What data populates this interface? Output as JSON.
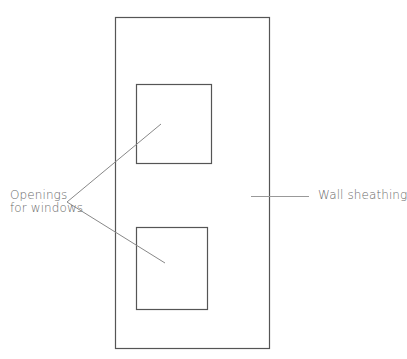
{
  "diagram": {
    "type": "wall-sheathing-elevation",
    "labels": {
      "openings_line1": "Openings",
      "openings_line2": "for windows",
      "wall_sheathing": "Wall sheathing"
    },
    "colors": {
      "outline": "#555555",
      "leader": "#888888",
      "text": "#6a6a6a"
    },
    "shapes": {
      "wall_panel": {
        "x": 115,
        "y": 17,
        "width": 154,
        "height": 331
      },
      "window_upper": {
        "x": 136,
        "y": 84,
        "width": 75,
        "height": 79
      },
      "window_lower": {
        "x": 136,
        "y": 227,
        "width": 71,
        "height": 82
      }
    },
    "leaders": {
      "openings_to_upper": {
        "x1": 67,
        "y1": 202,
        "x2": 161,
        "y2": 124
      },
      "openings_to_lower": {
        "x1": 67,
        "y1": 202,
        "x2": 165,
        "y2": 263
      },
      "wall_sheathing": {
        "x1": 251,
        "y1": 196,
        "x2": 309,
        "y2": 196
      }
    }
  }
}
